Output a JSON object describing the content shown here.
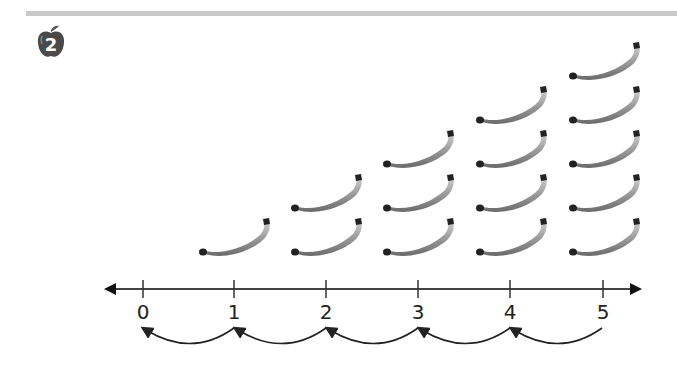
{
  "problem": {
    "number": "2",
    "badge_icon": "apple-icon"
  },
  "number_line": {
    "labels": [
      "0",
      "1",
      "2",
      "3",
      "4",
      "5"
    ],
    "hops": "backward jumps of 1 from 5 to 0"
  },
  "banana_columns": [
    {
      "at": "1",
      "count": 1
    },
    {
      "at": "2",
      "count": 2
    },
    {
      "at": "3",
      "count": 3
    },
    {
      "at": "4",
      "count": 4
    },
    {
      "at": "5",
      "count": 5
    }
  ],
  "colors": {
    "line": "#333333",
    "bar": "#c8c8c8",
    "badge": "#4a4a4a"
  }
}
